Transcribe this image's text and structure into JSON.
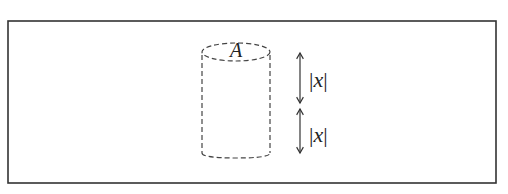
{
  "diagram": {
    "frame": {
      "x": 8,
      "y": 21,
      "width": 488,
      "height": 162,
      "stroke": "#333333"
    },
    "cylinder": {
      "label": "A",
      "cx": 236,
      "top_y": 52,
      "bottom_y": 155,
      "rx": 34,
      "ry": 9,
      "stroke": "#444444",
      "style": "dashed"
    },
    "dimensions": [
      {
        "label_bar_left": "|",
        "label_var": "x",
        "label_bar_right": "|",
        "x": 300,
        "y1": 52,
        "y2": 104
      },
      {
        "label_bar_left": "|",
        "label_var": "x",
        "label_bar_right": "|",
        "x": 300,
        "y1": 108,
        "y2": 154
      }
    ],
    "colors": {
      "line": "#333333",
      "text": "#222222",
      "background": "#ffffff"
    }
  }
}
